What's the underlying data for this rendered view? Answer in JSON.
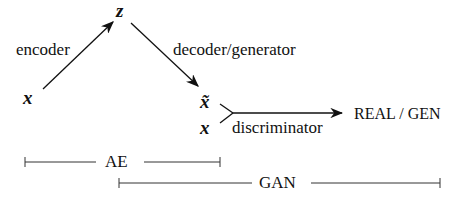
{
  "nodes": {
    "x_input": "x",
    "z_latent": "z",
    "x_tilde": "x̃",
    "x_real": "x"
  },
  "edges": {
    "encoder": "encoder",
    "decoder": "decoder/generator",
    "discriminator": "discriminator"
  },
  "output": "REAL / GEN",
  "spans": {
    "ae": "AE",
    "gan": "GAN"
  },
  "colors": {
    "ink": "#111111",
    "background": "#ffffff"
  }
}
